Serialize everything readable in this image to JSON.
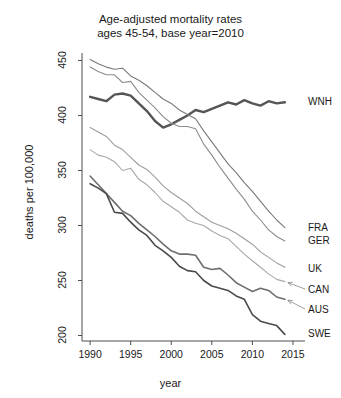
{
  "chart_data": {
    "type": "line",
    "title": "Age-adjusted mortality rates",
    "subtitle": "ages 45-54, base year=2010",
    "xlabel": "year",
    "ylabel": "deaths per 100,000",
    "xlim": [
      1989,
      2015.5
    ],
    "ylim": [
      195,
      455
    ],
    "xticks": [
      1990,
      1995,
      2000,
      2005,
      2010,
      2015
    ],
    "yticks": [
      200,
      250,
      300,
      350,
      400,
      450
    ],
    "grid": false,
    "legend_position": "right-inline-labels",
    "annotations": [
      {
        "text": "CAN",
        "arrow": true,
        "points_to_series": "CAN"
      },
      {
        "text": "AUS",
        "arrow": true,
        "points_to_series": "AUS"
      }
    ],
    "x": [
      1990,
      1991,
      1992,
      1993,
      1994,
      1995,
      1996,
      1997,
      1998,
      1999,
      2000,
      2001,
      2002,
      2003,
      2004,
      2005,
      2006,
      2007,
      2008,
      2009,
      2010,
      2011,
      2012,
      2013,
      2014
    ],
    "series": [
      {
        "name": "WNH",
        "label": "WNH",
        "color": "#555555",
        "width": 2.4,
        "values": [
          417,
          415,
          413,
          419,
          420,
          418,
          411,
          404,
          395,
          389,
          392,
          396,
          400,
          405,
          403,
          406,
          409,
          412,
          410,
          414,
          411,
          409,
          413,
          411,
          412
        ]
      },
      {
        "name": "FRA",
        "label": "FRA",
        "color": "#7a7a7a",
        "width": 1.1,
        "values": [
          451,
          447,
          444,
          442,
          443,
          436,
          432,
          427,
          421,
          415,
          411,
          405,
          401,
          397,
          386,
          376,
          366,
          356,
          348,
          339,
          331,
          322,
          313,
          305,
          298
        ]
      },
      {
        "name": "GER",
        "label": "GER",
        "color": "#8c8c8c",
        "width": 1.1,
        "values": [
          444,
          440,
          437,
          437,
          430,
          431,
          421,
          414,
          407,
          399,
          393,
          390,
          390,
          388,
          374,
          364,
          353,
          343,
          333,
          324,
          313,
          305,
          296,
          290,
          286
        ]
      },
      {
        "name": "UK",
        "label": "UK",
        "color": "#9e9e9e",
        "width": 1.1,
        "values": [
          389,
          385,
          381,
          373,
          369,
          362,
          355,
          351,
          344,
          336,
          330,
          325,
          320,
          313,
          308,
          303,
          300,
          297,
          293,
          288,
          283,
          276,
          271,
          266,
          262
        ]
      },
      {
        "name": "CAN",
        "label": "CAN",
        "color": "#a8a8a8",
        "width": 1.1,
        "values": [
          369,
          364,
          362,
          358,
          350,
          352,
          342,
          337,
          330,
          322,
          317,
          312,
          305,
          302,
          300,
          295,
          291,
          288,
          281,
          274,
          268,
          262,
          256,
          251,
          249
        ]
      },
      {
        "name": "AUS",
        "label": "AUS",
        "color": "#6e6e6e",
        "width": 1.6,
        "values": [
          345,
          337,
          329,
          321,
          313,
          309,
          302,
          296,
          290,
          283,
          277,
          274,
          274,
          273,
          262,
          260,
          261,
          255,
          248,
          244,
          240,
          243,
          241,
          235,
          233
        ]
      },
      {
        "name": "SWE",
        "label": "SWE",
        "color": "#4a4a4a",
        "width": 1.6,
        "values": [
          338,
          334,
          329,
          312,
          311,
          303,
          296,
          291,
          282,
          277,
          271,
          263,
          259,
          258,
          250,
          245,
          243,
          241,
          236,
          233,
          219,
          213,
          211,
          209,
          201
        ]
      }
    ],
    "series_end_labels": [
      {
        "name": "WNH",
        "text": "WNH"
      },
      {
        "name": "FRA",
        "text": "FRA"
      },
      {
        "name": "GER",
        "text": "GER"
      },
      {
        "name": "UK",
        "text": "UK"
      },
      {
        "name": "CAN",
        "text": "CAN"
      },
      {
        "name": "AUS",
        "text": "AUS"
      },
      {
        "name": "SWE",
        "text": "SWE"
      }
    ]
  }
}
